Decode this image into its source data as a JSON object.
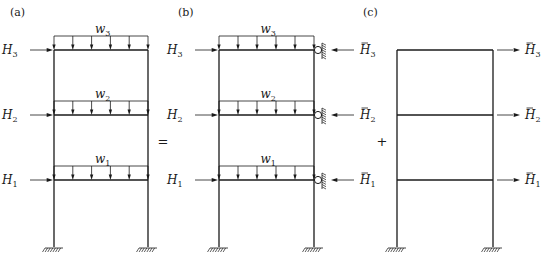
{
  "figure": {
    "panels": [
      {
        "id": "a",
        "label": "(a)",
        "label_pos": [
          10,
          16
        ],
        "left_x": 54,
        "right_x": 148,
        "floors_y": [
          50,
          115,
          180
        ],
        "ground_y": 247,
        "distributed_loads": [
          {
            "name": "w1",
            "base": "w",
            "sub": "1",
            "floor": 0
          },
          {
            "name": "w2",
            "base": "w",
            "sub": "2",
            "floor": 1
          },
          {
            "name": "w3",
            "base": "w",
            "sub": "3",
            "floor": 2
          }
        ],
        "left_forces": [
          {
            "base": "H",
            "sub": "1",
            "bar": false,
            "floor": 0
          },
          {
            "base": "H",
            "sub": "2",
            "bar": false,
            "floor": 1
          },
          {
            "base": "H",
            "sub": "3",
            "bar": false,
            "floor": 2
          }
        ],
        "right_supports": false,
        "right_forces": []
      },
      {
        "id": "b",
        "label": "(b)",
        "label_pos": [
          178,
          16
        ],
        "left_x": 219,
        "right_x": 314,
        "floors_y": [
          50,
          115,
          180
        ],
        "ground_y": 247,
        "distributed_loads": [
          {
            "name": "w1",
            "base": "w",
            "sub": "1",
            "floor": 0
          },
          {
            "name": "w2",
            "base": "w",
            "sub": "2",
            "floor": 1
          },
          {
            "name": "w3",
            "base": "w",
            "sub": "3",
            "floor": 2
          }
        ],
        "left_forces": [
          {
            "base": "H",
            "sub": "1",
            "bar": false,
            "floor": 0
          },
          {
            "base": "H",
            "sub": "2",
            "bar": false,
            "floor": 1
          },
          {
            "base": "H",
            "sub": "3",
            "bar": false,
            "floor": 2
          }
        ],
        "right_supports": true,
        "right_forces": [
          {
            "base": "H",
            "sub": "1",
            "bar": true,
            "floor": 0,
            "direction": "left"
          },
          {
            "base": "H",
            "sub": "2",
            "bar": true,
            "floor": 1,
            "direction": "left"
          },
          {
            "base": "H",
            "sub": "3",
            "bar": true,
            "floor": 2,
            "direction": "left"
          }
        ]
      },
      {
        "id": "c",
        "label": "(c)",
        "label_pos": [
          363,
          16
        ],
        "left_x": 397,
        "right_x": 493,
        "floors_y": [
          50,
          115,
          180
        ],
        "ground_y": 247,
        "distributed_loads": [],
        "left_forces": [],
        "right_supports": false,
        "right_forces": [
          {
            "base": "H",
            "sub": "1",
            "bar": true,
            "floor": 0,
            "direction": "right"
          },
          {
            "base": "H",
            "sub": "2",
            "bar": true,
            "floor": 1,
            "direction": "right"
          },
          {
            "base": "H",
            "sub": "3",
            "bar": true,
            "floor": 2,
            "direction": "right"
          }
        ]
      }
    ],
    "operators": [
      {
        "symbol": "=",
        "x": 163,
        "y": 146
      },
      {
        "symbol": "+",
        "x": 382,
        "y": 146
      }
    ],
    "colors": {
      "ink": "#1a1a1a",
      "background": "#ffffff"
    }
  }
}
